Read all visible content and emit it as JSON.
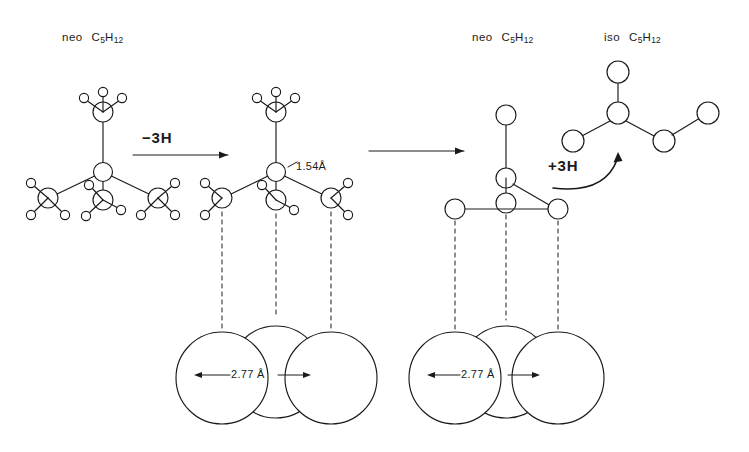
{
  "figure": {
    "background_color": "#ffffff",
    "line_color": "#1a1a1a",
    "width": 749,
    "height": 452
  },
  "labels": {
    "neo_left": {
      "prefix": "neo",
      "formula_c": "C",
      "formula_c_sub": "5",
      "formula_h": "H",
      "formula_h_sub": "12",
      "text": "neo C5H12"
    },
    "neo_right": {
      "prefix": "neo",
      "formula_c": "C",
      "formula_c_sub": "5",
      "formula_h": "H",
      "formula_h_sub": "12",
      "text": "neo C5H12"
    },
    "iso_right": {
      "prefix": "iso",
      "formula_c": "C",
      "formula_c_sub": "5",
      "formula_h": "H",
      "formula_h_sub": "12",
      "text": "iso C5H12"
    }
  },
  "reactions": {
    "step1": {
      "label": "−3H",
      "arrow": "right-arrow"
    },
    "step2": {
      "label": "",
      "arrow": "right-arrow"
    },
    "step3": {
      "label": "+3H",
      "arrow": "curved-up-arrow"
    }
  },
  "measurements": {
    "bond_length": {
      "value": "1.54",
      "unit": "Å",
      "text": "1.54Å"
    },
    "spacing_left": {
      "value": "2.77",
      "unit": "Å",
      "text": "2.77 Å"
    },
    "spacing_right": {
      "value": "2.77",
      "unit": "Å",
      "text": "2.77 Å"
    }
  },
  "structures": {
    "neopentane_full": {
      "name": "neopentane",
      "carbons": 5,
      "hydrogens": 12,
      "description": "central carbon with four methyl groups, three pointing down and one up"
    },
    "neopentane_minus_3h": {
      "name": "neopentane minus 3 hydrogens",
      "carbons": 5,
      "hydrogens": 9,
      "description": "three bottom methyls each lost one hydrogen, bonds project down to surface"
    },
    "adsorbed_skeleton": {
      "name": "adsorbed neopentane carbon skeleton",
      "carbons": 5,
      "hydrogens": 0,
      "description": "carbon skeleton bound to three surface atoms"
    },
    "isopentane": {
      "name": "isopentane",
      "carbons": 5,
      "hydrogens": 12,
      "description": "branched chain, 2-methylbutane"
    }
  },
  "surface": {
    "left_group": {
      "atom_count": 3,
      "arrangement": "three overlapping spheres, middle raised"
    },
    "right_group": {
      "atom_count": 3,
      "arrangement": "three overlapping spheres, middle raised"
    },
    "projection_lines": 6
  }
}
